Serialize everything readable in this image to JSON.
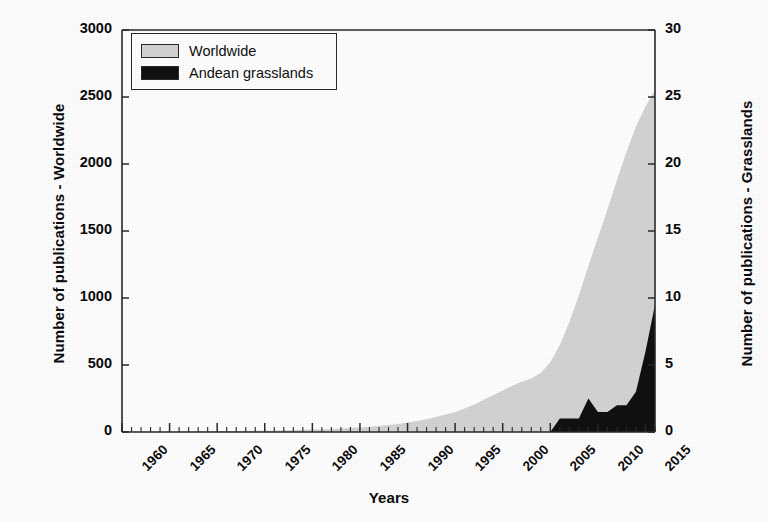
{
  "chart_data": {
    "type": "area",
    "title": "",
    "xlabel": "Years",
    "ylabel": "Number of publications - Worldwide",
    "ylabel_secondary": "Number of publications - Grasslands",
    "xlim": [
      1960,
      2016
    ],
    "ylim": [
      0,
      3000
    ],
    "ylim_secondary": [
      0,
      30
    ],
    "xticks": [
      1960,
      1965,
      1970,
      1975,
      1980,
      1985,
      1990,
      1995,
      2000,
      2005,
      2010,
      2015
    ],
    "xtick_labels": [
      "1960",
      "1965",
      "1970",
      "1975",
      "1980",
      "1985",
      "1990",
      "1995",
      "2000",
      "2005",
      "2010",
      "2015"
    ],
    "xtick_minor_step": 1,
    "yticks": [
      0,
      500,
      1000,
      1500,
      2000,
      2500,
      3000
    ],
    "ytick_labels": [
      "0",
      "500",
      "1000",
      "1500",
      "2000",
      "2500",
      "3000"
    ],
    "yticks_secondary": [
      0,
      5,
      10,
      15,
      20,
      25,
      30
    ],
    "ytick_labels_secondary": [
      "0",
      "5",
      "10",
      "15",
      "20",
      "25",
      "30"
    ],
    "grid": false,
    "legend_position": "upper left",
    "colors": {
      "worldwide": "#d4d4d4",
      "andean_grasslands": "#111111",
      "axis": "#2a2a2a",
      "text": "#0b0b0b",
      "background": "#ffffff"
    },
    "x": [
      1960,
      1961,
      1962,
      1963,
      1964,
      1965,
      1966,
      1967,
      1968,
      1969,
      1970,
      1971,
      1972,
      1973,
      1974,
      1975,
      1976,
      1977,
      1978,
      1979,
      1980,
      1981,
      1982,
      1983,
      1984,
      1985,
      1986,
      1987,
      1988,
      1989,
      1990,
      1991,
      1992,
      1993,
      1994,
      1995,
      1996,
      1997,
      1998,
      1999,
      2000,
      2001,
      2002,
      2003,
      2004,
      2005,
      2006,
      2007,
      2008,
      2009,
      2010,
      2011,
      2012,
      2013,
      2014,
      2015,
      2016
    ],
    "series": [
      {
        "name": "Worldwide",
        "axis": "left",
        "color": "#d4d4d4",
        "values": [
          2,
          2,
          3,
          3,
          4,
          4,
          5,
          5,
          6,
          6,
          7,
          8,
          8,
          9,
          10,
          11,
          12,
          13,
          14,
          16,
          18,
          20,
          23,
          26,
          30,
          34,
          39,
          45,
          52,
          60,
          70,
          82,
          96,
          112,
          130,
          150,
          175,
          205,
          240,
          275,
          310,
          345,
          375,
          400,
          440,
          520,
          650,
          820,
          1020,
          1240,
          1450,
          1660,
          1880,
          2090,
          2280,
          2430,
          2550
        ]
      },
      {
        "name": "Andean grasslands",
        "axis": "right",
        "color": "#111111",
        "values": [
          0,
          0,
          0,
          0,
          0,
          0,
          0,
          0,
          0,
          0,
          0,
          0,
          0,
          0,
          0,
          0,
          0,
          0,
          0,
          0,
          0,
          0,
          0,
          0,
          0,
          0,
          0,
          0,
          0,
          0,
          0,
          0,
          0,
          0,
          0,
          0,
          0,
          0,
          0,
          0,
          0,
          0,
          0,
          0,
          0,
          0,
          1,
          1,
          1,
          2.5,
          1.5,
          1.5,
          2,
          2,
          3,
          6,
          9.5
        ]
      }
    ]
  },
  "legend": {
    "items": [
      {
        "label": "Worldwide",
        "swatch": "light-gray"
      },
      {
        "label": "Andean grasslands",
        "swatch": "black"
      }
    ]
  },
  "axes": {
    "left_title": "Number of publications - Worldwide",
    "right_title": "Number of publications - Grasslands",
    "bottom_title": "Years"
  }
}
